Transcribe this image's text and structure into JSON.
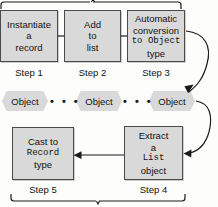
{
  "diagram": {
    "top_steps": [
      {
        "id": "step1",
        "lines": [
          "Instantiate",
          "a",
          "record"
        ],
        "mono_lines": [
          false,
          false,
          false
        ],
        "label": "Step 1"
      },
      {
        "id": "step2",
        "lines": [
          "Add",
          "to",
          "list"
        ],
        "mono_lines": [
          false,
          false,
          false
        ],
        "label": "Step 2"
      },
      {
        "id": "step3",
        "lines": [
          "Automatic",
          "conversion",
          "to Object",
          "type"
        ],
        "mono_lines": [
          false,
          false,
          "partial",
          false
        ],
        "label": "Step 3"
      }
    ],
    "object_nodes": [
      {
        "id": "object1",
        "label": "Object"
      },
      {
        "id": "object2",
        "label": "Object"
      },
      {
        "id": "object3",
        "label": "Object"
      }
    ],
    "ellipsis": "• • •",
    "bottom_steps": [
      {
        "id": "step5",
        "lines": [
          "Cast to",
          "Record",
          "type"
        ],
        "mono_lines": [
          false,
          true,
          false
        ],
        "label": "Step 5"
      },
      {
        "id": "step4",
        "lines": [
          "Extract",
          "a",
          "List",
          "object"
        ],
        "mono_lines": [
          false,
          false,
          true,
          false
        ],
        "label": "Step 4"
      }
    ],
    "colors": {
      "node_fill": "#d9d9d9",
      "node_stroke": "#4a4a4a",
      "line": "#1a1a1a",
      "text": "#111111",
      "background": "#fdfdfc"
    }
  }
}
